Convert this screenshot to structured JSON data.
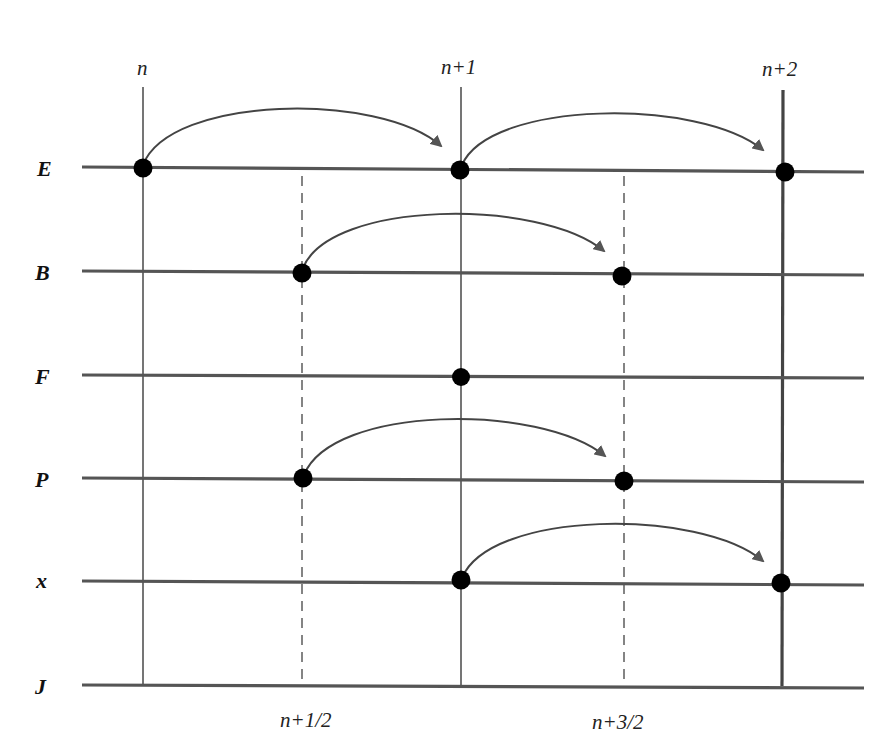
{
  "diagram": {
    "title": "",
    "type": "staggered time-stepping (leapfrog) scheme",
    "colors": {
      "line": "#555555",
      "node": "#000000",
      "arrow": "#444444",
      "background": "#ffffff"
    },
    "time_labels_top": [
      {
        "id": "n",
        "label": "n",
        "x": 143
      },
      {
        "id": "n1",
        "label": "n+1",
        "x": 461
      },
      {
        "id": "n2",
        "label": "n+2",
        "x": 783
      }
    ],
    "time_labels_bottom": [
      {
        "id": "nhalf",
        "label": "n+1/2",
        "x": 302
      },
      {
        "id": "n3half",
        "label": "n+3/2",
        "x": 624
      }
    ],
    "rows": [
      {
        "id": "E",
        "label": "E",
        "y": 168
      },
      {
        "id": "B",
        "label": "B",
        "y": 272
      },
      {
        "id": "F",
        "label": "F",
        "y": 376
      },
      {
        "id": "P",
        "label": "P",
        "y": 479
      },
      {
        "id": "x",
        "label": "x",
        "y": 582
      },
      {
        "id": "J",
        "label": "J",
        "y": 686
      }
    ],
    "nodes": [
      {
        "row": "E",
        "time": "n"
      },
      {
        "row": "E",
        "time": "n+1"
      },
      {
        "row": "E",
        "time": "n+2"
      },
      {
        "row": "B",
        "time": "n+1/2"
      },
      {
        "row": "B",
        "time": "n+3/2"
      },
      {
        "row": "F",
        "time": "n+1"
      },
      {
        "row": "P",
        "time": "n+1/2"
      },
      {
        "row": "P",
        "time": "n+3/2"
      },
      {
        "row": "x",
        "time": "n+1"
      },
      {
        "row": "x",
        "time": "n+2"
      }
    ],
    "arrows": [
      {
        "row": "E",
        "from": "n",
        "to": "n+1"
      },
      {
        "row": "E",
        "from": "n+1",
        "to": "n+2"
      },
      {
        "row": "B",
        "from": "n+1/2",
        "to": "n+3/2"
      },
      {
        "row": "P",
        "from": "n+1/2",
        "to": "n+3/2"
      },
      {
        "row": "x",
        "from": "n+1",
        "to": "n+2"
      }
    ]
  }
}
